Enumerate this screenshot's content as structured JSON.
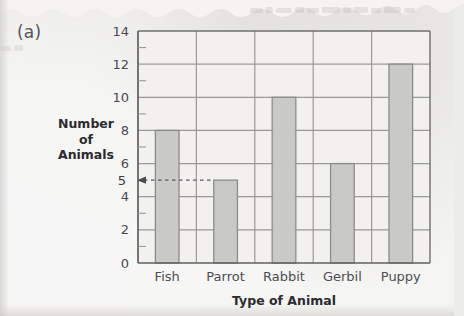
{
  "figure": {
    "label": "(a)"
  },
  "chart_data": {
    "type": "bar",
    "title": "",
    "xlabel": "Type of Animal",
    "ylabel": "Number of Animals",
    "ylabel_lines": [
      "Number",
      "of",
      "Animals"
    ],
    "categories": [
      "Fish",
      "Parrot",
      "Rabbit",
      "Gerbil",
      "Puppy"
    ],
    "values": [
      8,
      5,
      10,
      6,
      12
    ],
    "ylim": [
      0,
      14
    ],
    "ytick_labels": [
      "0",
      "2",
      "4",
      "6",
      "8",
      "10",
      "12",
      "14"
    ],
    "ytick_values": [
      0,
      2,
      4,
      6,
      8,
      10,
      12,
      14
    ],
    "yminor_values": [
      1,
      3,
      5,
      7,
      9,
      11,
      13
    ],
    "grid": "horizontal-major",
    "legend": "none",
    "bar_color": "#c9c9c7",
    "bar_edge_color": "#8b8b89",
    "axis_color": "#6e6e6e",
    "gridline_color": "#9a9a98",
    "annotation": {
      "label": "5",
      "value": 5,
      "style": "dashed-leader-with-arrow",
      "points_to": "Parrot",
      "description": "Dashed horizontal leader line at y = 5 with a left arrowhead marking the height of the Parrot bar."
    }
  }
}
